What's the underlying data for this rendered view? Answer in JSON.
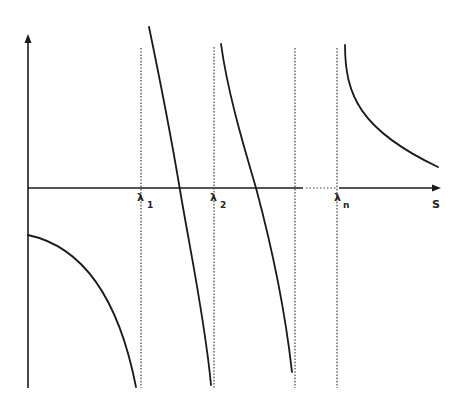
{
  "diagram": {
    "type": "secular-equation-plot",
    "x_axis_label": "S",
    "labels": {
      "lambda1": {
        "symbol": "λ",
        "sub": "1"
      },
      "lambda2": {
        "symbol": "λ",
        "sub": "2"
      },
      "lambdan": {
        "symbol": "λ",
        "sub": "n"
      }
    },
    "colors": {
      "line": "#1a1a1a",
      "asymptote": "#555555",
      "background": "#ffffff"
    },
    "asymptotes_x": [
      141,
      214,
      295,
      337
    ],
    "axis": {
      "origin_x": 28,
      "baseline_y": 188,
      "top_y": 35,
      "bottom_y": 388,
      "right_x": 440,
      "gap_start_x": 303,
      "gap_end_x": 339
    },
    "branches": [
      {
        "name": "branch-0",
        "from": [
          28,
          235
        ],
        "to": [
          136,
          387
        ],
        "shape": "concave-down"
      },
      {
        "name": "branch-1",
        "from": [
          149,
          27
        ],
        "to": [
          211,
          385
        ],
        "crosses_axis_x": 179
      },
      {
        "name": "branch-2",
        "from": [
          221,
          44
        ],
        "to": [
          292,
          372
        ],
        "crosses_axis_x": 256
      },
      {
        "name": "branch-n",
        "from": [
          345,
          45
        ],
        "to": [
          438,
          167
        ],
        "shape": "decaying"
      }
    ]
  }
}
